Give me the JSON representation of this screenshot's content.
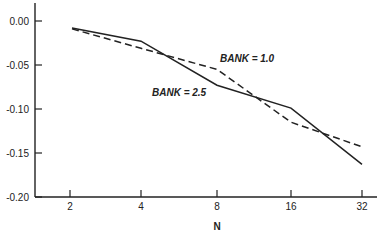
{
  "chart_data": {
    "type": "line",
    "title": "",
    "xlabel": "N",
    "ylabel": "",
    "x_scale": "log2",
    "x": [
      2,
      4,
      8,
      16,
      32
    ],
    "x_tick_labels": [
      "2",
      "4",
      "8",
      "16",
      "32"
    ],
    "y_ticks": [
      0.0,
      -0.05,
      -0.1,
      -0.15,
      -0.2
    ],
    "y_tick_labels": [
      "0.00",
      "-0.05",
      "-0.10",
      "-0.15",
      "-0.20"
    ],
    "ylim": [
      -0.2,
      0.02
    ],
    "grid": false,
    "legend": "inline annotations",
    "series": [
      {
        "name": "BANK = 2.5",
        "style": "solid",
        "values": [
          -0.008,
          -0.023,
          -0.073,
          -0.099,
          -0.163
        ]
      },
      {
        "name": "BANK = 1.0",
        "style": "dashed",
        "values": [
          -0.009,
          -0.031,
          -0.055,
          -0.115,
          -0.143
        ]
      }
    ],
    "annotations": [
      {
        "text": "BANK = 1.0",
        "series": 1
      },
      {
        "text": "BANK = 2.5",
        "series": 0
      }
    ]
  }
}
